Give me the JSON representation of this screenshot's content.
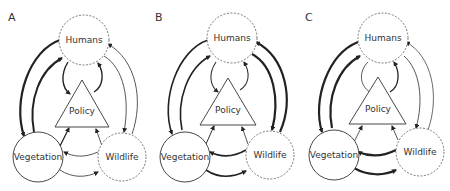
{
  "panels": [
    {
      "label": "A",
      "nodes": {
        "humans": "Humans",
        "policy": "Policy",
        "vegetation": "Vegetation",
        "wildlife": "Wildlife"
      },
      "node_styles": {
        "humans": "dashed",
        "vegetation": "solid",
        "wildlife": "dashed"
      },
      "edges": [
        {
          "from": "Humans",
          "to": "Vegetation",
          "weight": "thick"
        },
        {
          "from": "Vegetation",
          "to": "Humans",
          "weight": "thick"
        },
        {
          "from": "Humans",
          "to": "Policy",
          "weight": "medium"
        },
        {
          "from": "Policy",
          "to": "Humans",
          "weight": "medium"
        },
        {
          "from": "Humans",
          "to": "Wildlife",
          "weight": "thin"
        },
        {
          "from": "Wildlife",
          "to": "Humans",
          "weight": "thin"
        },
        {
          "from": "Vegetation",
          "to": "Policy",
          "weight": "medium"
        },
        {
          "from": "Wildlife",
          "to": "Policy",
          "weight": "thin"
        },
        {
          "from": "Wildlife",
          "to": "Vegetation",
          "weight": "thin"
        },
        {
          "from": "Vegetation",
          "to": "Wildlife",
          "weight": "thin"
        }
      ]
    },
    {
      "label": "B",
      "nodes": {
        "humans": "Humans",
        "policy": "Policy",
        "vegetation": "Vegetation",
        "wildlife": "Wildlife"
      },
      "node_styles": {
        "humans": "dashed",
        "vegetation": "solid",
        "wildlife": "dashed"
      },
      "edges": [
        {
          "from": "Humans",
          "to": "Vegetation",
          "weight": "medium"
        },
        {
          "from": "Vegetation",
          "to": "Humans",
          "weight": "medium"
        },
        {
          "from": "Humans",
          "to": "Policy",
          "weight": "thin"
        },
        {
          "from": "Policy",
          "to": "Humans",
          "weight": "thin"
        },
        {
          "from": "Humans",
          "to": "Wildlife",
          "weight": "thick"
        },
        {
          "from": "Wildlife",
          "to": "Humans",
          "weight": "thick"
        },
        {
          "from": "Vegetation",
          "to": "Policy",
          "weight": "thin"
        },
        {
          "from": "Wildlife",
          "to": "Policy",
          "weight": "thin"
        },
        {
          "from": "Wildlife",
          "to": "Vegetation",
          "weight": "medium"
        },
        {
          "from": "Vegetation",
          "to": "Wildlife",
          "weight": "medium"
        }
      ]
    },
    {
      "label": "C",
      "nodes": {
        "humans": "Humans",
        "policy": "Policy",
        "vegetation": "Vegetation",
        "wildlife": "Wildlife"
      },
      "node_styles": {
        "humans": "dashed",
        "vegetation": "solid",
        "wildlife": "dashed"
      },
      "edges": [
        {
          "from": "Humans",
          "to": "Vegetation",
          "weight": "thick"
        },
        {
          "from": "Vegetation",
          "to": "Humans",
          "weight": "thick"
        },
        {
          "from": "Humans",
          "to": "Policy",
          "weight": "thin"
        },
        {
          "from": "Policy",
          "to": "Humans",
          "weight": "thin"
        },
        {
          "from": "Humans",
          "to": "Wildlife",
          "weight": "thin"
        },
        {
          "from": "Wildlife",
          "to": "Humans",
          "weight": "thin"
        },
        {
          "from": "Vegetation",
          "to": "Policy",
          "weight": "thin"
        },
        {
          "from": "Wildlife",
          "to": "Policy",
          "weight": "thin"
        },
        {
          "from": "Wildlife",
          "to": "Vegetation",
          "weight": "thick"
        },
        {
          "from": "Vegetation",
          "to": "Wildlife",
          "weight": "thick"
        }
      ]
    }
  ]
}
